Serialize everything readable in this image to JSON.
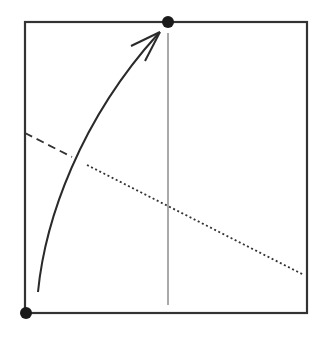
{
  "diagram": {
    "type": "origami-fold-step",
    "colors": {
      "paper_edge": "#333333",
      "reference_line": "#555555",
      "arrow": "#2a2a2a",
      "point_marker": "#1a1a1a",
      "background": "#ffffff"
    },
    "paper": {
      "x": 25,
      "y": 22,
      "width": 282,
      "height": 291
    },
    "points": [
      {
        "name": "top-center-point",
        "x": 168,
        "y": 22,
        "r": 6
      },
      {
        "name": "bottom-left-corner-point",
        "x": 26,
        "y": 313,
        "r": 6
      }
    ],
    "center_crease": {
      "x": 168,
      "y1": 33,
      "y2": 305
    },
    "valley_fold_line_visible": {
      "x1": 25,
      "y1": 133,
      "x2": 72,
      "y2": 157
    },
    "fold_line_hidden": {
      "x1": 87,
      "y1": 165,
      "x2": 304,
      "y2": 275
    },
    "fold_arrow": {
      "path": "M 38 292 C 45 220, 80 120, 158 34",
      "head_tip": {
        "x": 160,
        "y": 32
      }
    }
  }
}
